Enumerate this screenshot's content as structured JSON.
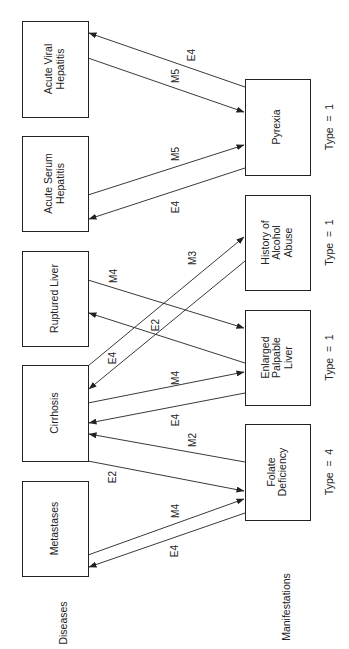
{
  "diagram": {
    "orientation": "rotated-90-ccw",
    "column_labels": {
      "diseases": "Diseases",
      "manifestations": "Manifestations"
    },
    "diseases": [
      {
        "id": "acute_viral",
        "lines": [
          "Acute Viral",
          "Hepatitis"
        ],
        "x": 22,
        "y": 21,
        "w": 66,
        "h": 96
      },
      {
        "id": "acute_serum",
        "lines": [
          "Acute Serum",
          "Hepatitis"
        ],
        "x": 22,
        "y": 136,
        "w": 66,
        "h": 95
      },
      {
        "id": "ruptured",
        "lines": [
          "Ruptured Liver"
        ],
        "x": 22,
        "y": 251,
        "w": 66,
        "h": 95
      },
      {
        "id": "cirrhosis",
        "lines": [
          "Cirrhosis"
        ],
        "x": 22,
        "y": 365,
        "w": 66,
        "h": 96
      },
      {
        "id": "metastases",
        "lines": [
          "Metastases"
        ],
        "x": 22,
        "y": 481,
        "w": 66,
        "h": 95
      }
    ],
    "manifestations": [
      {
        "id": "pyrexia",
        "lines": [
          "Pyrexia"
        ],
        "type_label": "Type  =  1",
        "x": 245,
        "y": 79,
        "w": 65,
        "h": 96
      },
      {
        "id": "history",
        "lines": [
          "History of",
          "Alcohol",
          "Abuse"
        ],
        "type_label": "Type  =  1",
        "x": 245,
        "y": 195,
        "w": 65,
        "h": 95
      },
      {
        "id": "enlarged",
        "lines": [
          "Enlarged",
          "Palpable",
          "Liver"
        ],
        "type_label": "Type  =  1",
        "x": 245,
        "y": 310,
        "w": 65,
        "h": 95
      },
      {
        "id": "folate",
        "lines": [
          "Folate",
          "Deficiency"
        ],
        "type_label": "Type  =  4",
        "x": 245,
        "y": 424,
        "w": 65,
        "h": 96
      }
    ],
    "edges": [
      {
        "from": "pyrexia",
        "to": "acute_viral",
        "label": "E4",
        "x1": 245,
        "y1": 87,
        "x2": 89,
        "y2": 33,
        "lx": 192,
        "ly": 55
      },
      {
        "from": "acute_viral",
        "to": "pyrexia",
        "label": "M5",
        "x1": 88,
        "y1": 58,
        "x2": 244,
        "y2": 112,
        "lx": 176,
        "ly": 76
      },
      {
        "from": "acute_serum",
        "to": "pyrexia",
        "label": "M5",
        "x1": 88,
        "y1": 195,
        "x2": 244,
        "y2": 145,
        "lx": 176,
        "ly": 154
      },
      {
        "from": "pyrexia",
        "to": "acute_serum",
        "label": "E4",
        "x1": 245,
        "y1": 168,
        "x2": 89,
        "y2": 219,
        "lx": 176,
        "ly": 207
      },
      {
        "from": "ruptured",
        "to": "enlarged",
        "label": "M4",
        "x1": 88,
        "y1": 280,
        "x2": 244,
        "y2": 328,
        "lx": 114,
        "ly": 276
      },
      {
        "from": "enlarged",
        "to": "ruptured",
        "label": "E2",
        "x1": 245,
        "y1": 363,
        "x2": 89,
        "y2": 313,
        "lx": 156,
        "ly": 325
      },
      {
        "from": "cirrhosis",
        "to": "history",
        "label": "M3",
        "x1": 88,
        "y1": 366,
        "x2": 244,
        "y2": 237,
        "lx": 193,
        "ly": 258
      },
      {
        "from": "history",
        "to": "cirrhosis",
        "label": "E4",
        "x1": 245,
        "y1": 261,
        "x2": 89,
        "y2": 389,
        "lx": 113,
        "ly": 358
      },
      {
        "from": "cirrhosis",
        "to": "enlarged",
        "label": "M4",
        "x1": 88,
        "y1": 403,
        "x2": 244,
        "y2": 372,
        "lx": 176,
        "ly": 378
      },
      {
        "from": "enlarged",
        "to": "cirrhosis",
        "label": "E4",
        "x1": 245,
        "y1": 393,
        "x2": 89,
        "y2": 423,
        "lx": 176,
        "ly": 420
      },
      {
        "from": "folate",
        "to": "cirrhosis",
        "label": "M2",
        "x1": 245,
        "y1": 462,
        "x2": 89,
        "y2": 434,
        "lx": 193,
        "ly": 440
      },
      {
        "from": "cirrhosis",
        "to": "folate",
        "label": "E2",
        "x1": 88,
        "y1": 461,
        "x2": 244,
        "y2": 491,
        "lx": 113,
        "ly": 477
      },
      {
        "from": "metastases",
        "to": "folate",
        "label": "M4",
        "x1": 88,
        "y1": 555,
        "x2": 244,
        "y2": 499,
        "lx": 176,
        "ly": 511
      },
      {
        "from": "folate",
        "to": "metastases",
        "label": "E4",
        "x1": 245,
        "y1": 513,
        "x2": 89,
        "y2": 567,
        "lx": 175,
        "ly": 551
      }
    ],
    "column_label_positions": {
      "diseases": {
        "x": 64,
        "y": 623
      },
      "manifestations": {
        "x": 287,
        "y": 607
      }
    },
    "type_label_x": 330,
    "colors": {
      "stroke": "#222222",
      "background": "#ffffff"
    }
  }
}
